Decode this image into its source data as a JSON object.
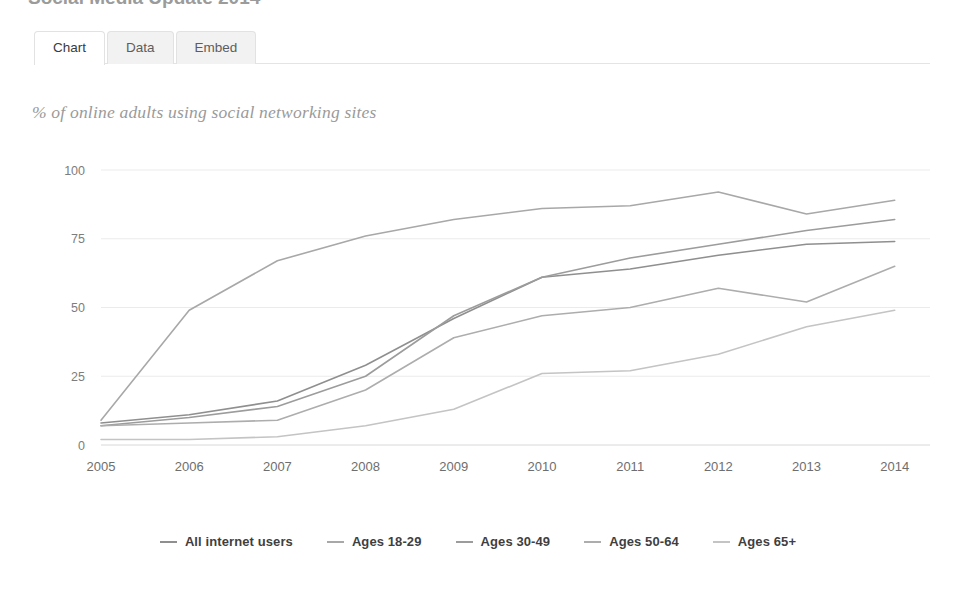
{
  "header": {
    "cut_off_title": "Social Media Update 2014"
  },
  "tabs": [
    {
      "label": "Chart",
      "active": true
    },
    {
      "label": "Data",
      "active": false
    },
    {
      "label": "Embed",
      "active": false
    }
  ],
  "chart_data": {
    "type": "line",
    "title": "",
    "subtitle": "% of online adults using social networking sites",
    "xlabel": "",
    "ylabel": "",
    "x": [
      2005,
      2006,
      2007,
      2008,
      2009,
      2010,
      2011,
      2012,
      2013,
      2014
    ],
    "categories": [
      "2005",
      "2006",
      "2007",
      "2008",
      "2009",
      "2010",
      "2011",
      "2012",
      "2013",
      "2014"
    ],
    "xlim": [
      2005,
      2014.4
    ],
    "ylim": [
      0,
      100
    ],
    "yticks": [
      0,
      25,
      50,
      75,
      100
    ],
    "ytick_labels": [
      "0",
      "25",
      "50",
      "75",
      "100"
    ],
    "grid": true,
    "legend_position": "bottom",
    "series": [
      {
        "name": "All internet users",
        "color": "#8f8f8f",
        "values": [
          8,
          11,
          16,
          29,
          46,
          61,
          64,
          69,
          73,
          74
        ]
      },
      {
        "name": "Ages 18-29",
        "color": "#a8a8a8",
        "values": [
          9,
          49,
          67,
          76,
          82,
          86,
          87,
          92,
          84,
          89
        ]
      },
      {
        "name": "Ages 30-49",
        "color": "#9c9c9c",
        "values": [
          7,
          10,
          14,
          25,
          47,
          61,
          68,
          73,
          78,
          82
        ]
      },
      {
        "name": "Ages 50-64",
        "color": "#adadad",
        "values": [
          7,
          8,
          9,
          20,
          39,
          47,
          50,
          57,
          52,
          65
        ]
      },
      {
        "name": "Ages 65+",
        "color": "#c4c4c4",
        "values": [
          2,
          2,
          3,
          7,
          13,
          26,
          27,
          33,
          43,
          49
        ]
      }
    ]
  },
  "legend": [
    {
      "label": "All internet users",
      "color": "#8f8f8f"
    },
    {
      "label": "Ages 18-29",
      "color": "#a8a8a8"
    },
    {
      "label": "Ages 30-49",
      "color": "#9c9c9c"
    },
    {
      "label": "Ages 50-64",
      "color": "#adadad"
    },
    {
      "label": "Ages 65+",
      "color": "#c4c4c4"
    }
  ]
}
